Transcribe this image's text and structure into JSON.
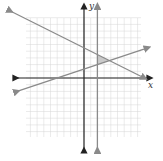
{
  "chart_data": {
    "type": "line",
    "title": "",
    "xlabel": "x",
    "ylabel": "y",
    "xlim": [
      -8.5,
      8.5
    ],
    "ylim": [
      -9,
      9
    ],
    "grid": true,
    "series": [
      {
        "name": "vertical line x = 2",
        "kind": "vertical",
        "x": 2
      },
      {
        "name": "descending line",
        "points": [
          [
            -11,
            10
          ],
          [
            9,
            0
          ]
        ]
      },
      {
        "name": "ascending line",
        "points": [
          [
            -10,
            -2
          ],
          [
            9.5,
            4.5
          ]
        ]
      }
    ],
    "shaded_region": {
      "description": "triangle bounded by the three lines",
      "vertices": [
        [
          2,
          3.5
        ],
        [
          2,
          2
        ],
        [
          3.8,
          2.6
        ]
      ]
    }
  },
  "labels": {
    "x_axis": "x",
    "y_axis": "y"
  },
  "colors": {
    "axis": "#222222",
    "line": "#8a8a8a",
    "grid": "#d6d6d6",
    "shade": "#bdbdbd"
  }
}
